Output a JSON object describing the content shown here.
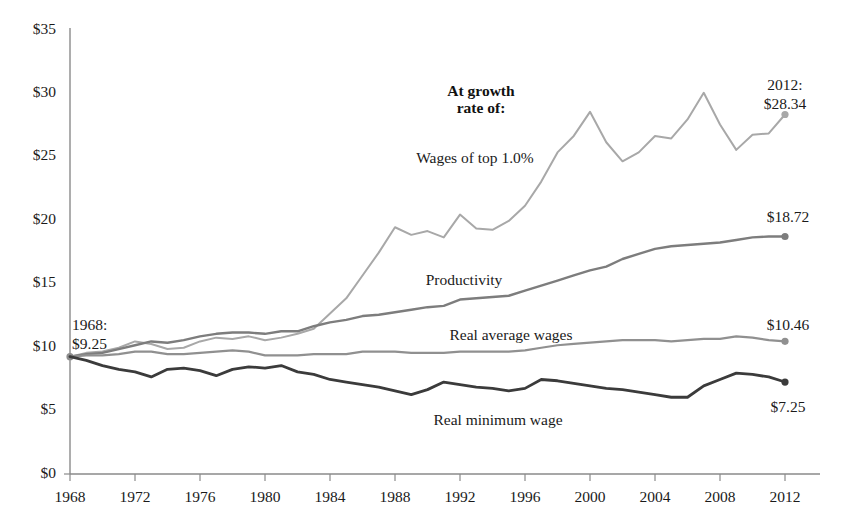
{
  "chart_data": {
    "type": "line",
    "title": "",
    "subtitle": "",
    "xlabel": "",
    "ylabel": "",
    "xlim": [
      1968,
      2012
    ],
    "ylim": [
      0,
      35
    ],
    "grid": false,
    "legend_position": "inline-labels",
    "y_ticks": [
      "$0",
      "$5",
      "$10",
      "$15",
      "$20",
      "$25",
      "$30",
      "$35"
    ],
    "y_tick_values": [
      0,
      5,
      10,
      15,
      20,
      25,
      30,
      35
    ],
    "x_ticks": [
      "1968",
      "1972",
      "1976",
      "1980",
      "1984",
      "1988",
      "1992",
      "1996",
      "2000",
      "2004",
      "2008",
      "2012"
    ],
    "x_tick_values": [
      1968,
      1972,
      1976,
      1980,
      1984,
      1988,
      1992,
      1996,
      2000,
      2004,
      2008,
      2012
    ],
    "x": [
      1968,
      1969,
      1970,
      1971,
      1972,
      1973,
      1974,
      1975,
      1976,
      1977,
      1978,
      1979,
      1980,
      1981,
      1982,
      1983,
      1984,
      1985,
      1986,
      1987,
      1988,
      1989,
      1990,
      1991,
      1992,
      1993,
      1994,
      1995,
      1996,
      1997,
      1998,
      1999,
      2000,
      2001,
      2002,
      2003,
      2004,
      2005,
      2006,
      2007,
      2008,
      2009,
      2010,
      2011,
      2012
    ],
    "series": [
      {
        "name": "Wages of top 1.0%",
        "color": "#a8a8a8",
        "width": 2.0,
        "values": [
          9.25,
          9.55,
          9.65,
          9.95,
          10.45,
          10.25,
          9.85,
          9.95,
          10.45,
          10.75,
          10.65,
          10.85,
          10.55,
          10.75,
          11.05,
          11.45,
          12.65,
          13.85,
          15.65,
          17.45,
          19.45,
          18.85,
          19.15,
          18.65,
          20.45,
          19.35,
          19.25,
          19.95,
          21.15,
          23.05,
          25.35,
          26.65,
          28.55,
          26.15,
          24.65,
          25.35,
          26.65,
          26.45,
          27.95,
          30.05,
          27.55,
          25.55,
          26.75,
          26.85,
          28.34
        ]
      },
      {
        "name": "Productivity",
        "color": "#7d7d7d",
        "width": 2.4,
        "values": [
          9.25,
          9.45,
          9.55,
          9.85,
          10.15,
          10.45,
          10.35,
          10.55,
          10.85,
          11.05,
          11.15,
          11.15,
          11.05,
          11.25,
          11.25,
          11.65,
          11.95,
          12.15,
          12.45,
          12.55,
          12.75,
          12.95,
          13.15,
          13.25,
          13.75,
          13.85,
          13.95,
          14.05,
          14.45,
          14.85,
          15.25,
          15.65,
          16.05,
          16.35,
          16.95,
          17.35,
          17.75,
          17.95,
          18.05,
          18.15,
          18.25,
          18.45,
          18.65,
          18.72,
          18.72
        ]
      },
      {
        "name": "Real average wages",
        "color": "#909090",
        "width": 2.2,
        "values": [
          9.25,
          9.35,
          9.35,
          9.45,
          9.65,
          9.65,
          9.45,
          9.45,
          9.55,
          9.65,
          9.75,
          9.65,
          9.35,
          9.35,
          9.35,
          9.45,
          9.45,
          9.45,
          9.65,
          9.65,
          9.65,
          9.55,
          9.55,
          9.55,
          9.65,
          9.65,
          9.65,
          9.65,
          9.75,
          9.95,
          10.15,
          10.25,
          10.35,
          10.45,
          10.55,
          10.55,
          10.55,
          10.45,
          10.55,
          10.65,
          10.65,
          10.85,
          10.75,
          10.55,
          10.46
        ]
      },
      {
        "name": "Real minimum wage",
        "color": "#3b3b3b",
        "width": 2.8,
        "values": [
          9.25,
          8.95,
          8.55,
          8.25,
          8.05,
          7.65,
          8.25,
          8.35,
          8.15,
          7.75,
          8.25,
          8.45,
          8.35,
          8.55,
          8.05,
          7.85,
          7.45,
          7.25,
          7.05,
          6.85,
          6.55,
          6.25,
          6.65,
          7.25,
          7.05,
          6.85,
          6.75,
          6.55,
          6.75,
          7.45,
          7.35,
          7.15,
          6.95,
          6.75,
          6.65,
          6.45,
          6.25,
          6.05,
          6.05,
          6.95,
          7.45,
          7.95,
          7.85,
          7.65,
          7.25
        ]
      }
    ],
    "annotations": [
      {
        "name": "growth-rate-header",
        "text_line1": "At growth",
        "text_line2": "rate of:",
        "bold": true
      },
      {
        "name": "top1-label",
        "text": "Wages of top 1.0%"
      },
      {
        "name": "productivity-label",
        "text": "Productivity"
      },
      {
        "name": "real-average-wages-label",
        "text": "Real average wages"
      },
      {
        "name": "real-minimum-wage-label",
        "text": "Real minimum wage"
      },
      {
        "name": "start-value-label",
        "text_line1": "1968:",
        "text_line2": "$9.25"
      },
      {
        "name": "top1-end-label",
        "text_line1": "2012:",
        "text_line2": "$28.34"
      },
      {
        "name": "productivity-end-label",
        "text": "$18.72"
      },
      {
        "name": "real-average-wages-end-label",
        "text": "$10.46"
      },
      {
        "name": "real-minimum-wage-end-label",
        "text": "$7.25"
      }
    ]
  },
  "axis": {
    "y_labels": [
      "$35",
      "$30",
      "$25",
      "$20",
      "$15",
      "$10",
      "$5",
      "$0"
    ],
    "x_labels": [
      "1968",
      "1972",
      "1976",
      "1980",
      "1984",
      "1988",
      "1992",
      "1996",
      "2000",
      "2004",
      "2008",
      "2012"
    ]
  },
  "annotations": {
    "growth_line1": "At growth",
    "growth_line2": "rate of:",
    "top1": "Wages of top 1.0%",
    "productivity": "Productivity",
    "real_average_wages": "Real average wages",
    "real_minimum_wage": "Real minimum wage",
    "start_line1": "1968:",
    "start_line2": "$9.25",
    "top1_end_line1": "2012:",
    "top1_end_line2": "$28.34",
    "productivity_end": "$18.72",
    "real_average_wages_end": "$10.46",
    "real_minimum_wage_end": "$7.25"
  }
}
